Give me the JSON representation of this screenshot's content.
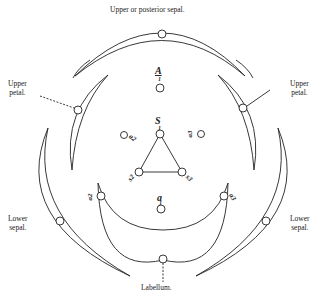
{
  "diagram": {
    "type": "floral-diagram-orchid",
    "labels": {
      "top_sepal": "Upper or posterior sepal.",
      "upper_petal_left": [
        "Upper",
        "petal."
      ],
      "upper_petal_right": [
        "Upper",
        "petal."
      ],
      "lower_sepal_left": [
        "Lower",
        "sepal."
      ],
      "lower_sepal_right": [
        "Lower",
        "sepal."
      ],
      "labellum": "Labellum."
    },
    "symbols": {
      "anther_top": "A",
      "anther_top_sub": "1",
      "stigma_center": "S",
      "stigma_center_sub": "1",
      "anther_bottom": "a",
      "anther_bottom_sub": "1",
      "left_upper_marker": "a2",
      "right_upper_marker": "a3",
      "triangle_left": "s2",
      "triangle_right": "s3",
      "lower_left_marker": "a2",
      "lower_right_marker": "a3"
    },
    "colors": {
      "ink": "#222222",
      "background": "#ffffff"
    }
  }
}
